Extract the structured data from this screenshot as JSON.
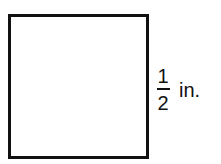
{
  "figure": {
    "shape": "square",
    "side_label": {
      "numerator": "1",
      "denominator": "2",
      "unit": "in."
    }
  }
}
